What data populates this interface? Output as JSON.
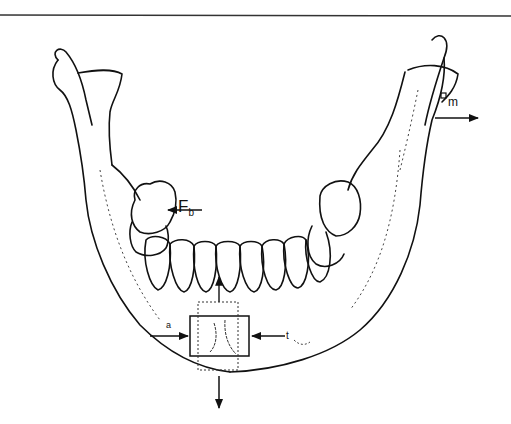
{
  "figure": {
    "labels": {
      "bite_force": {
        "main": "F",
        "sub": "b"
      },
      "muscle_force": {
        "main": "",
        "sub": "m"
      },
      "left_small": "a",
      "right_small": "t"
    },
    "colors": {
      "ink": "#111111",
      "background": "#ffffff",
      "rule": "#333333"
    }
  }
}
